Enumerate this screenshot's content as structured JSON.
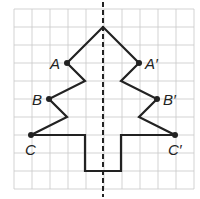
{
  "diagram": {
    "grid": {
      "x0": 14,
      "y0": 9,
      "cell": 18,
      "cols": 10,
      "rows": 10,
      "line_color": "#c8c8c8"
    },
    "axis": {
      "x": 103,
      "style": "dashed",
      "color": "#222222"
    },
    "shape_color": "#222222",
    "points": [
      {
        "label": "A",
        "x": 67,
        "y": 63,
        "lx": 50,
        "ly": 69
      },
      {
        "label": "B",
        "x": 49,
        "y": 99,
        "lx": 32,
        "ly": 105
      },
      {
        "label": "C",
        "x": 31,
        "y": 135,
        "lx": 25,
        "ly": 155
      },
      {
        "label": "A′",
        "x": 139,
        "y": 63,
        "lx": 145,
        "ly": 69
      },
      {
        "label": "B′",
        "x": 157,
        "y": 99,
        "lx": 163,
        "ly": 105
      },
      {
        "label": "C′",
        "x": 175,
        "y": 135,
        "lx": 168,
        "ly": 155
      }
    ],
    "outline": [
      [
        31,
        135
      ],
      [
        67,
        117
      ],
      [
        49,
        99
      ],
      [
        85,
        81
      ],
      [
        67,
        63
      ],
      [
        103,
        27
      ],
      [
        139,
        63
      ],
      [
        121,
        81
      ],
      [
        157,
        99
      ],
      [
        139,
        117
      ],
      [
        175,
        135
      ],
      [
        121,
        135
      ],
      [
        121,
        171
      ],
      [
        85,
        171
      ],
      [
        85,
        135
      ],
      [
        31,
        135
      ]
    ]
  }
}
